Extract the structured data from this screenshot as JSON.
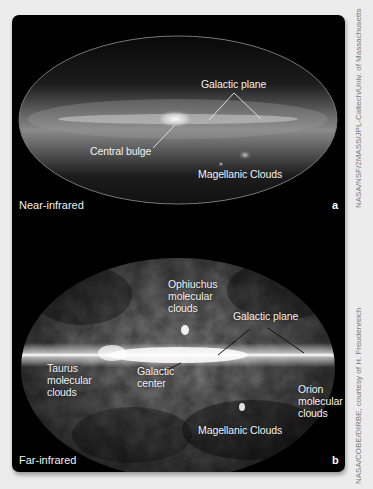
{
  "figure": {
    "panels": [
      {
        "id": "a",
        "letter": "a",
        "band": "Near-infrared",
        "labels": {
          "galactic_plane": "Galactic plane",
          "central_bulge": "Central bulge",
          "magellanic_clouds": "Magellanic Clouds"
        },
        "credit": "NASA/NSF/2MASS/JPL-Caltech/Univ. of Massachusetts"
      },
      {
        "id": "b",
        "letter": "b",
        "band": "Far-infrared",
        "labels": {
          "ophiuchus_1": "Ophiuchus",
          "ophiuchus_2": "molecular",
          "ophiuchus_3": "clouds",
          "galactic_plane": "Galactic plane",
          "taurus_1": "Taurus",
          "taurus_2": "molecular",
          "taurus_3": "clouds",
          "galactic_center_1": "Galactic",
          "galactic_center_2": "center",
          "orion_1": "Orion",
          "orion_2": "molecular",
          "orion_3": "clouds",
          "magellanic_clouds": "Magellanic Clouds"
        },
        "credit": "NASA/COBE/DIRBE, courtesy of H. Freudenreich"
      }
    ],
    "colors": {
      "background": "#ececec",
      "panel": "#000000",
      "label": "#f2f2f2",
      "credit": "#7a7a7a"
    }
  }
}
